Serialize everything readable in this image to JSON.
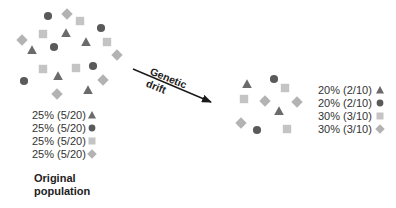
{
  "colors": {
    "triangle": "#6b6b6b",
    "circle": "#5a5a5a",
    "square": "#c4c4c4",
    "diamond": "#b3b3b3",
    "arrow": "#1a1a1a",
    "text": "#333333"
  },
  "original_population": {
    "caption_line1": "Original",
    "caption_line2": "population",
    "individuals": [
      {
        "shape": "circle",
        "x": 48,
        "y": 16
      },
      {
        "shape": "diamond",
        "x": 67,
        "y": 14
      },
      {
        "shape": "square",
        "x": 80,
        "y": 21
      },
      {
        "shape": "circle",
        "x": 101,
        "y": 28
      },
      {
        "shape": "square",
        "x": 43,
        "y": 34
      },
      {
        "shape": "triangle",
        "x": 66,
        "y": 33
      },
      {
        "shape": "triangle",
        "x": 86,
        "y": 42
      },
      {
        "shape": "square",
        "x": 107,
        "y": 42
      },
      {
        "shape": "diamond",
        "x": 22,
        "y": 40
      },
      {
        "shape": "triangle",
        "x": 32,
        "y": 50
      },
      {
        "shape": "circle",
        "x": 54,
        "y": 47
      },
      {
        "shape": "diamond",
        "x": 117,
        "y": 55
      },
      {
        "shape": "square",
        "x": 43,
        "y": 69
      },
      {
        "shape": "triangle",
        "x": 58,
        "y": 76
      },
      {
        "shape": "square",
        "x": 76,
        "y": 68
      },
      {
        "shape": "circle",
        "x": 93,
        "y": 66
      },
      {
        "shape": "circle",
        "x": 24,
        "y": 81
      },
      {
        "shape": "diamond",
        "x": 103,
        "y": 80
      },
      {
        "shape": "diamond",
        "x": 57,
        "y": 94
      },
      {
        "shape": "triangle",
        "x": 88,
        "y": 90
      }
    ],
    "legend": [
      {
        "label": "25% (5/20)",
        "shape": "triangle"
      },
      {
        "label": "25% (5/20)",
        "shape": "circle"
      },
      {
        "label": "25% (5/20)",
        "shape": "square"
      },
      {
        "label": "25% (5/20)",
        "shape": "diamond"
      }
    ]
  },
  "arrow": {
    "label_line1": "Genetic",
    "label_line2": "drift",
    "x1": 133,
    "y1": 69,
    "x2": 211,
    "y2": 102
  },
  "drifted_population": {
    "individuals": [
      {
        "shape": "triangle",
        "x": 247,
        "y": 84
      },
      {
        "shape": "circle",
        "x": 274,
        "y": 79
      },
      {
        "shape": "square",
        "x": 285,
        "y": 88
      },
      {
        "shape": "square",
        "x": 244,
        "y": 99
      },
      {
        "shape": "diamond",
        "x": 265,
        "y": 101
      },
      {
        "shape": "diamond",
        "x": 297,
        "y": 102
      },
      {
        "shape": "triangle",
        "x": 279,
        "y": 111
      },
      {
        "shape": "diamond",
        "x": 241,
        "y": 123
      },
      {
        "shape": "circle",
        "x": 257,
        "y": 130
      },
      {
        "shape": "square",
        "x": 287,
        "y": 129
      }
    ],
    "legend": [
      {
        "label": "20% (2/10)",
        "shape": "triangle"
      },
      {
        "label": "20% (2/10)",
        "shape": "circle"
      },
      {
        "label": "30% (3/10)",
        "shape": "square"
      },
      {
        "label": "30% (3/10)",
        "shape": "diamond"
      }
    ]
  }
}
